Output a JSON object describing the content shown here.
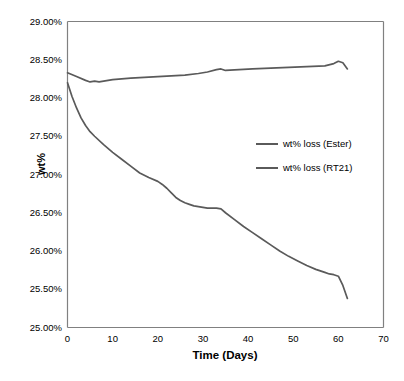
{
  "chart_data": {
    "type": "line",
    "title": "",
    "xlabel": "Time (Days)",
    "ylabel": "wt%",
    "xlim": [
      0,
      70
    ],
    "ylim": [
      25.0,
      29.0
    ],
    "grid": false,
    "legend_position": "center-right",
    "x_ticks": [
      "0",
      "10",
      "20",
      "30",
      "40",
      "50",
      "60",
      "70"
    ],
    "x_tick_values": [
      0,
      10,
      20,
      30,
      40,
      50,
      60,
      70
    ],
    "y_ticks": [
      "25.00%",
      "25.50%",
      "26.00%",
      "26.50%",
      "27.00%",
      "27.50%",
      "28.00%",
      "28.50%",
      "29.00%"
    ],
    "y_tick_values": [
      25.0,
      25.5,
      26.0,
      26.5,
      27.0,
      27.5,
      28.0,
      28.5,
      29.0
    ],
    "series": [
      {
        "name": "wt% loss (Ester)",
        "color": "#5a5a5a",
        "x": [
          0,
          2,
          4,
          5,
          6,
          7,
          8,
          10,
          12,
          14,
          17,
          20,
          23,
          26,
          29,
          31,
          33,
          34,
          35,
          38,
          41,
          45,
          49,
          53,
          57,
          59,
          60,
          61,
          62
        ],
        "y": [
          28.33,
          28.28,
          28.23,
          28.21,
          28.22,
          28.21,
          28.22,
          28.24,
          28.25,
          28.26,
          28.27,
          28.28,
          28.29,
          28.3,
          28.32,
          28.34,
          28.37,
          28.38,
          28.36,
          28.37,
          28.38,
          28.39,
          28.4,
          28.41,
          28.42,
          28.45,
          28.48,
          28.46,
          28.38
        ]
      },
      {
        "name": "wt% loss (RT21)",
        "color": "#5a5a5a",
        "x": [
          0,
          1,
          2,
          3,
          4,
          5,
          6,
          8,
          10,
          12,
          14,
          16,
          18,
          20,
          21,
          22,
          23,
          24,
          25,
          26,
          27,
          28,
          29,
          30,
          31,
          32,
          33,
          34,
          35,
          37,
          39,
          41,
          43,
          45,
          47,
          49,
          51,
          53,
          55,
          57,
          58,
          59,
          60,
          61,
          62
        ],
        "y": [
          28.2,
          28.02,
          27.87,
          27.74,
          27.64,
          27.56,
          27.5,
          27.39,
          27.29,
          27.2,
          27.11,
          27.02,
          26.96,
          26.91,
          26.87,
          26.82,
          26.76,
          26.7,
          26.66,
          26.63,
          26.61,
          26.59,
          26.58,
          26.57,
          26.56,
          26.56,
          26.56,
          26.55,
          26.5,
          26.41,
          26.32,
          26.24,
          26.16,
          26.08,
          26.0,
          25.93,
          25.87,
          25.81,
          25.76,
          25.72,
          25.7,
          25.69,
          25.67,
          25.55,
          25.38
        ]
      }
    ]
  },
  "axis": {
    "x_title": "Time (Days)",
    "y_title": "wt%"
  },
  "legend": {
    "items": [
      {
        "label": "wt% loss (Ester)"
      },
      {
        "label": "wt% loss (RT21)"
      }
    ]
  },
  "style": {
    "line_color": "#5a5a5a",
    "axis_color": "#808080",
    "background": "#ffffff"
  }
}
